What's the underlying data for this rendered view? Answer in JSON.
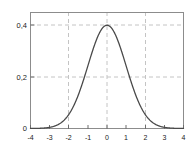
{
  "figure": {
    "background_color": "#ffffff",
    "frame_color": "#8c8c8c",
    "grid_color": "#c4c4c4",
    "curve_color": "#4a4a4a",
    "tick_label_color": "#1a1a1a"
  },
  "chart_data": {
    "type": "line",
    "title": "",
    "subtitle": "",
    "xlabel": "",
    "ylabel": "",
    "xlim": [
      -4,
      4
    ],
    "ylim": [
      0,
      0.45
    ],
    "grid": true,
    "grid_style": "dashed",
    "grid_x": [
      -2,
      0,
      2
    ],
    "grid_y": [
      0.2,
      0.4
    ],
    "legend": null,
    "legend_position": "none",
    "xticks": [
      -4,
      -3,
      -2,
      -1,
      0,
      1,
      2,
      3,
      4
    ],
    "xtick_labels": [
      "-4",
      "-3",
      "-2",
      "-1",
      "0",
      "1",
      "2",
      "3",
      "4"
    ],
    "yticks": [
      0,
      0.2,
      0.4
    ],
    "ytick_labels": [
      "0",
      "0,2",
      "0,4"
    ],
    "series": [
      {
        "name": "standard normal pdf",
        "x": [
          -4,
          -3.8,
          -3.6,
          -3.4,
          -3.2,
          -3,
          -2.8,
          -2.6,
          -2.4,
          -2.2,
          -2,
          -1.8,
          -1.6,
          -1.4,
          -1.2,
          -1,
          -0.8,
          -0.6,
          -0.4,
          -0.2,
          0,
          0.2,
          0.4,
          0.6,
          0.8,
          1,
          1.2,
          1.4,
          1.6,
          1.8,
          2,
          2.2,
          2.4,
          2.6,
          2.8,
          3,
          3.2,
          3.4,
          3.6,
          3.8,
          4
        ],
        "values": [
          0.0001,
          0.0003,
          0.0006,
          0.0012,
          0.0024,
          0.0044,
          0.0079,
          0.0136,
          0.0224,
          0.0355,
          0.054,
          0.079,
          0.1109,
          0.1497,
          0.1942,
          0.242,
          0.2897,
          0.3332,
          0.3683,
          0.391,
          0.3989,
          0.391,
          0.3683,
          0.3332,
          0.2897,
          0.242,
          0.1942,
          0.1497,
          0.1109,
          0.079,
          0.054,
          0.0355,
          0.0224,
          0.0136,
          0.0079,
          0.0044,
          0.0024,
          0.0012,
          0.0006,
          0.0003,
          0.0001
        ]
      }
    ]
  }
}
